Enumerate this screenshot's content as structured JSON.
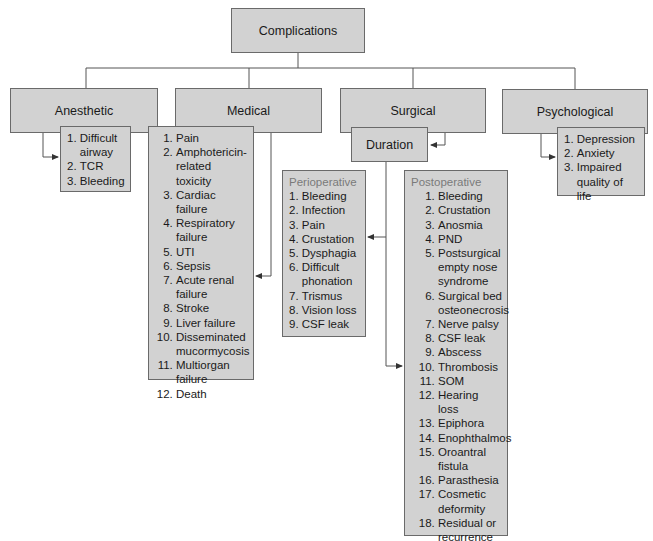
{
  "root": {
    "label": "Complications"
  },
  "categories": [
    {
      "label": "Anesthetic",
      "items": [
        {
          "n": "1. ",
          "t": "Difficult airway"
        },
        {
          "n": "2. ",
          "t": "TCR"
        },
        {
          "n": "3. ",
          "t": "Bleeding"
        }
      ]
    },
    {
      "label": "Medical",
      "items": [
        {
          "n": "1. ",
          "t": "Pain"
        },
        {
          "n": "2. ",
          "t": "Amphotericin-related toxicity"
        },
        {
          "n": "3. ",
          "t": "Cardiac failure"
        },
        {
          "n": "4. ",
          "t": "Respiratory failure"
        },
        {
          "n": "5. ",
          "t": "UTI"
        },
        {
          "n": "6. ",
          "t": "Sepsis"
        },
        {
          "n": "7. ",
          "t": "Acute renal failure"
        },
        {
          "n": "8. ",
          "t": "Stroke"
        },
        {
          "n": "9. ",
          "t": "Liver failure"
        },
        {
          "n": "10. ",
          "t": "Disseminated mucormycosis"
        },
        {
          "n": "11. ",
          "t": "Multiorgan failure"
        },
        {
          "n": "12. ",
          "t": "Death"
        }
      ]
    },
    {
      "label": "Surgical",
      "sub": {
        "label": "Duration",
        "perioperative": {
          "title": "Perioperative",
          "items": [
            {
              "n": "1. ",
              "t": "Bleeding"
            },
            {
              "n": "2. ",
              "t": "Infection"
            },
            {
              "n": "3. ",
              "t": "Pain"
            },
            {
              "n": "4. ",
              "t": "Crustation"
            },
            {
              "n": "5. ",
              "t": "Dysphagia"
            },
            {
              "n": "6. ",
              "t": "Difficult phonation"
            },
            {
              "n": "7. ",
              "t": "Trismus"
            },
            {
              "n": "8. ",
              "t": "Vision loss"
            },
            {
              "n": "9. ",
              "t": "CSF leak"
            }
          ]
        },
        "postoperative": {
          "title": "Postoperative",
          "items": [
            {
              "n": "1. ",
              "t": "Bleeding"
            },
            {
              "n": "2. ",
              "t": "Crustation"
            },
            {
              "n": "3. ",
              "t": "Anosmia"
            },
            {
              "n": "4. ",
              "t": "PND"
            },
            {
              "n": "5. ",
              "t": "Postsurgical empty nose syndrome"
            },
            {
              "n": "6. ",
              "t": "Surgical bed osteonecrosis"
            },
            {
              "n": "7. ",
              "t": "Nerve palsy"
            },
            {
              "n": "8. ",
              "t": "CSF leak"
            },
            {
              "n": "9. ",
              "t": "Abscess"
            },
            {
              "n": "10. ",
              "t": "Thrombosis"
            },
            {
              "n": "11. ",
              "t": "SOM"
            },
            {
              "n": "12. ",
              "t": "Hearing loss"
            },
            {
              "n": "13. ",
              "t": "Epiphora"
            },
            {
              "n": "14. ",
              "t": "Enophthalmos"
            },
            {
              "n": "15. ",
              "t": "Oroantral fistula"
            },
            {
              "n": "16. ",
              "t": "Parasthesia"
            },
            {
              "n": "17. ",
              "t": "Cosmetic deformity"
            },
            {
              "n": "18. ",
              "t": "Residual or recurrence"
            }
          ]
        }
      }
    },
    {
      "label": "Psychological",
      "items": [
        {
          "n": "1. ",
          "t": "Depression"
        },
        {
          "n": "2. ",
          "t": "Anxiety"
        },
        {
          "n": "3. ",
          "t": "Impaired quality of life"
        }
      ]
    }
  ],
  "colors": {
    "box_fill": "#d2d2d2",
    "box_border": "#6a6a6a",
    "line": "#555555",
    "subtitle": "#7a7a7a"
  }
}
